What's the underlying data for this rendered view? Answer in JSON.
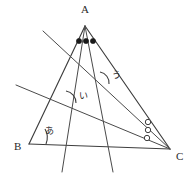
{
  "figure": {
    "type": "geometry-diagram",
    "background_color": "#ffffff",
    "line_color": "#3d3d3d",
    "text_color": "#2a2a2a",
    "vertices": [
      {
        "name": "vertex-a",
        "label": "A",
        "x": 85,
        "y": 26,
        "label_x": 81,
        "label_y": 13
      },
      {
        "name": "vertex-b",
        "label": "B",
        "x": 29,
        "y": 144,
        "label_x": 14,
        "label_y": 150
      },
      {
        "name": "vertex-c",
        "label": "C",
        "x": 170,
        "y": 149,
        "label_x": 176,
        "label_y": 160
      }
    ],
    "angle_labels": [
      {
        "name": "angle-label-a-b",
        "text": "あ",
        "x": 45,
        "y": 134
      },
      {
        "name": "angle-label-i",
        "text": "い",
        "x": 79,
        "y": 99
      },
      {
        "name": "angle-label-u",
        "text": "う",
        "x": 112,
        "y": 78
      }
    ],
    "angle_marks": {
      "apex_dots": {
        "name": "equal-angle-dots-at-a",
        "symbol": "filled-dot",
        "count": 3,
        "points": [
          {
            "x": 79,
            "y": 41
          },
          {
            "x": 86,
            "y": 41
          },
          {
            "x": 93,
            "y": 41
          }
        ]
      },
      "corner_circles": {
        "name": "equal-angle-circles-at-c",
        "symbol": "open-circle",
        "count": 3,
        "points": [
          {
            "x": 148,
            "y": 122
          },
          {
            "x": 148,
            "y": 130
          },
          {
            "x": 147,
            "y": 138
          }
        ]
      }
    }
  }
}
